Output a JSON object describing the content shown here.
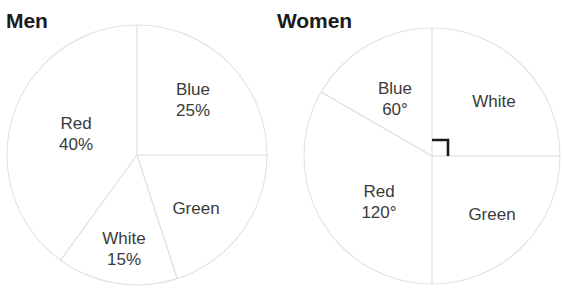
{
  "chart_data": [
    {
      "type": "pie",
      "title": "Men",
      "units": "percent",
      "center": {
        "x": 137,
        "y": 155
      },
      "radius": 130,
      "categories": [
        "Blue",
        "Green",
        "White",
        "Red"
      ],
      "values": [
        25,
        20,
        15,
        40
      ],
      "slices": [
        {
          "name": "Blue",
          "label_line1": "Blue",
          "label_line2": "25%",
          "value": 25,
          "start_deg": 0,
          "end_deg": 90,
          "label_x": 193,
          "label_y": 100,
          "show_value": true
        },
        {
          "name": "Green",
          "label_line1": "Green",
          "label_line2": "",
          "value": 20,
          "start_deg": 90,
          "end_deg": 162,
          "label_x": 196,
          "label_y": 208,
          "show_value": false
        },
        {
          "name": "White",
          "label_line1": "White",
          "label_line2": "15%",
          "value": 15,
          "start_deg": 162,
          "end_deg": 216,
          "label_x": 124,
          "label_y": 249,
          "show_value": true
        },
        {
          "name": "Red",
          "label_line1": "Red",
          "label_line2": "40%",
          "value": 40,
          "start_deg": 216,
          "end_deg": 360,
          "label_x": 76,
          "label_y": 134,
          "show_value": true
        }
      ],
      "legend": "none",
      "grid": false
    },
    {
      "type": "pie",
      "title": "Women",
      "units": "degrees",
      "center": {
        "x": 432,
        "y": 156
      },
      "radius": 128,
      "categories": [
        "White",
        "Green",
        "Red",
        "Blue"
      ],
      "values": [
        90,
        90,
        120,
        60
      ],
      "slices": [
        {
          "name": "White",
          "label_line1": "White",
          "label_line2": "",
          "value": 90,
          "start_deg": 0,
          "end_deg": 90,
          "label_x": 494,
          "label_y": 101,
          "show_value": false
        },
        {
          "name": "Green",
          "label_line1": "Green",
          "label_line2": "",
          "value": 90,
          "start_deg": 90,
          "end_deg": 180,
          "label_x": 492,
          "label_y": 214,
          "show_value": false
        },
        {
          "name": "Red",
          "label_line1": "Red",
          "label_line2": "120°",
          "value": 120,
          "start_deg": 180,
          "end_deg": 300,
          "label_x": 379,
          "label_y": 202,
          "show_value": true
        },
        {
          "name": "Blue",
          "label_line1": "Blue",
          "label_line2": "60°",
          "value": 60,
          "start_deg": 300,
          "end_deg": 360,
          "label_x": 395,
          "label_y": 99,
          "show_value": true
        }
      ],
      "annotations": [
        {
          "type": "right-angle-marker",
          "name": "right-angle-marker",
          "x": 432,
          "y": 156,
          "size": 16
        }
      ],
      "legend": "none",
      "grid": false
    }
  ],
  "colors": {
    "title_text": "#1b1b1b",
    "label_text": "#3b3b3b",
    "outline": "#e2e2e2",
    "divider": "#dcdcdc",
    "marker": "#1b1b1b",
    "background": "#ffffff"
  }
}
